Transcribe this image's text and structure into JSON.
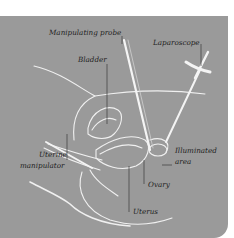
{
  "labels": {
    "manipulating_probe": "Manipulating probe",
    "laparoscope": "Laparoscope",
    "bladder": "Bladder",
    "illuminated_area_1": "Illuminated",
    "illuminated_area_2": "area",
    "uterine_manipulator_1": "Uterine",
    "uterine_manipulator_2": "manipulator",
    "ovary": "Ovary",
    "uterus": "Uterus"
  },
  "colors": {
    "background": "#9a9a9a",
    "outline": "#f2f2f2",
    "label_text": "#1e1e1e"
  }
}
